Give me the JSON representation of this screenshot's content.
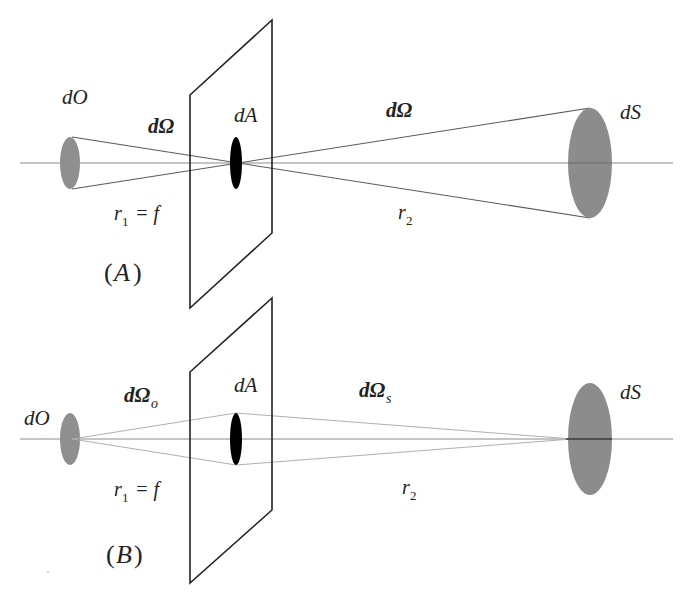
{
  "figure": {
    "colors": {
      "background": "#ffffff",
      "line": "#222222",
      "object_disk": "#8f8f8f",
      "aperture": "#000000",
      "source_disk": "#8c8c8c",
      "axis": "#8a8a8a"
    },
    "panels": [
      {
        "id": "A",
        "label": "(A)",
        "label_letter": "A",
        "object_label": "dO",
        "aperture_label": "dA",
        "source_label": "dS",
        "solid_angle_left": "dΩ",
        "solid_angle_right": "dΩ",
        "r1_label": "r",
        "r1_sub": "1",
        "r1_eq": "= f",
        "r2_label": "r",
        "r2_sub": "2"
      },
      {
        "id": "B",
        "label": "(B)",
        "label_letter": "B",
        "object_label": "dO",
        "aperture_label": "dA",
        "source_label": "dS",
        "solid_angle_left": "dΩ",
        "solid_angle_left_sub": "o",
        "solid_angle_right": "dΩ",
        "solid_angle_right_sub": "s",
        "r1_label": "r",
        "r1_sub": "1",
        "r1_eq": "= f",
        "r2_label": "r",
        "r2_sub": "2"
      }
    ]
  }
}
